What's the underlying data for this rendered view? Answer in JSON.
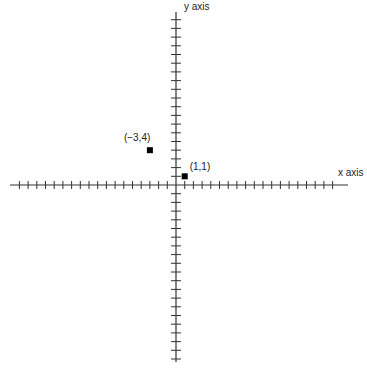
{
  "diagram": {
    "type": "coordinate-plane",
    "x_axis_label": "x axis",
    "y_axis_label": "y axis",
    "origin_px": [
      176,
      185
    ],
    "tick_spacing_px": 8.7,
    "x_ticks_each_side": 18,
    "y_ticks_up": 19,
    "y_ticks_down": 20,
    "axis_color": "#333333",
    "points": [
      {
        "label": "(−3,4)",
        "x": -3,
        "y": 4
      },
      {
        "label": "(1,1)",
        "x": 1,
        "y": 1
      }
    ]
  }
}
